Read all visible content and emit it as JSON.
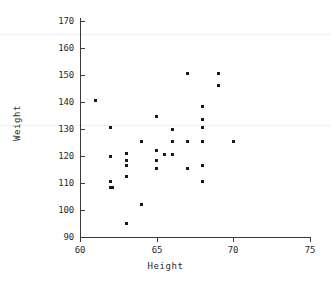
{
  "chart_data": {
    "type": "scatter",
    "title": "",
    "xlabel": "Height",
    "ylabel": "Weight",
    "xlim": [
      60,
      75
    ],
    "ylim": [
      90,
      170
    ],
    "xticks": [
      60,
      65,
      70,
      75
    ],
    "yticks": [
      90,
      100,
      110,
      120,
      130,
      140,
      150,
      160,
      170
    ],
    "grid": false,
    "legend": false,
    "marker": "square",
    "marker_color": "#1a1a1a",
    "points": [
      {
        "x": 61.0,
        "y": 140.5
      },
      {
        "x": 62.0,
        "y": 130.5
      },
      {
        "x": 62.0,
        "y": 120.0
      },
      {
        "x": 62.0,
        "y": 110.5
      },
      {
        "x": 62.0,
        "y": 108.5
      },
      {
        "x": 62.1,
        "y": 108.5
      },
      {
        "x": 63.0,
        "y": 121.0
      },
      {
        "x": 63.0,
        "y": 118.5
      },
      {
        "x": 63.0,
        "y": 116.5
      },
      {
        "x": 63.0,
        "y": 112.5
      },
      {
        "x": 63.0,
        "y": 95.0
      },
      {
        "x": 64.0,
        "y": 125.5
      },
      {
        "x": 64.0,
        "y": 102.0
      },
      {
        "x": 65.0,
        "y": 134.5
      },
      {
        "x": 65.0,
        "y": 122.0
      },
      {
        "x": 65.0,
        "y": 118.5
      },
      {
        "x": 65.0,
        "y": 115.5
      },
      {
        "x": 65.5,
        "y": 120.5
      },
      {
        "x": 66.0,
        "y": 130.0
      },
      {
        "x": 66.0,
        "y": 125.5
      },
      {
        "x": 66.0,
        "y": 120.5
      },
      {
        "x": 67.0,
        "y": 150.5
      },
      {
        "x": 67.0,
        "y": 125.5
      },
      {
        "x": 67.0,
        "y": 115.5
      },
      {
        "x": 68.0,
        "y": 138.5
      },
      {
        "x": 68.0,
        "y": 133.5
      },
      {
        "x": 68.0,
        "y": 130.5
      },
      {
        "x": 68.0,
        "y": 125.5
      },
      {
        "x": 68.0,
        "y": 116.5
      },
      {
        "x": 68.0,
        "y": 110.5
      },
      {
        "x": 69.0,
        "y": 150.5
      },
      {
        "x": 69.0,
        "y": 146.0
      },
      {
        "x": 70.0,
        "y": 125.5
      }
    ]
  },
  "axes": {
    "x_tick_labels": [
      "60",
      "65",
      "70",
      "75"
    ],
    "y_tick_labels": [
      "90",
      "100",
      "110",
      "120",
      "130",
      "140",
      "150",
      "160",
      "170"
    ],
    "x_axis_title": "Height",
    "y_axis_title": "Weight"
  }
}
